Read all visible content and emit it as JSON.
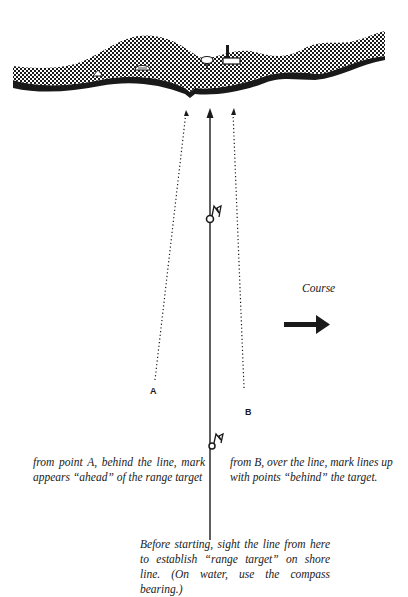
{
  "diagram": {
    "course_label": "Course",
    "point_a_label": "A",
    "point_b_label": "B",
    "caption_a": "from point A, behind the line, mark appears “ahead” of the range target",
    "caption_b": "from B, over the line, mark lines up with points “behind” the target.",
    "caption_start": "Before starting, sight the line from here to establish “range target” on shore line. (On water, use the compass bearing.)",
    "colors": {
      "ink": "#1a1a1a",
      "background": "#ffffff"
    },
    "elements": {
      "shoreline": "crosshatched shoreline with landmarks",
      "landmarks": [
        "small-house-icon",
        "building-icon",
        "water-tower-icon",
        "factory-chimney-icon"
      ],
      "range_mark": "flag-buoy-icon",
      "start_marker": "start-flag-buoy-icon"
    }
  }
}
